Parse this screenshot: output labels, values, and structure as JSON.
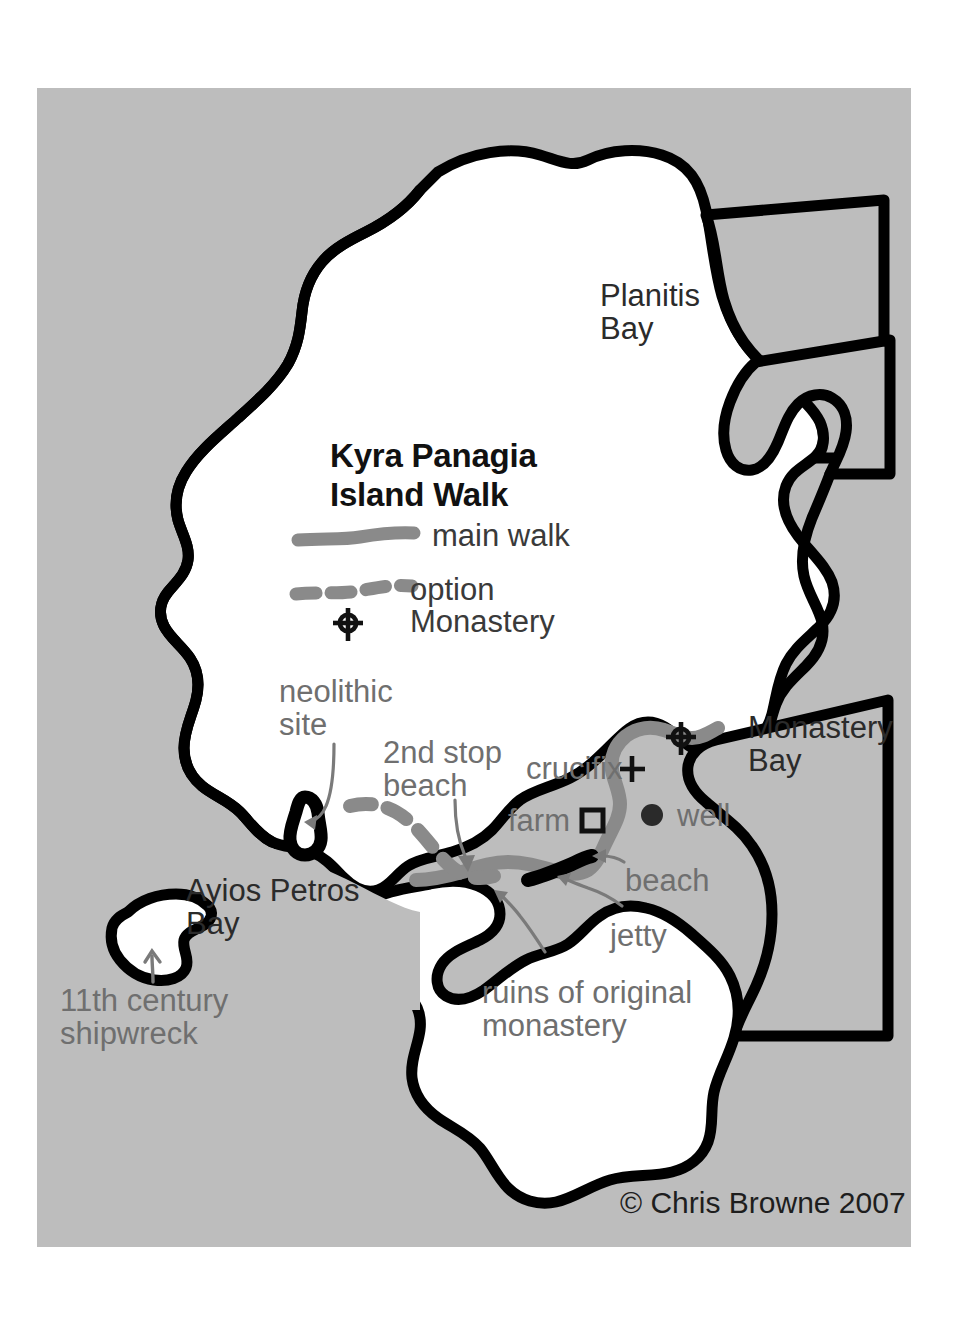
{
  "map": {
    "title_line1": "Kyra Panagia",
    "title_line2": "Island Walk",
    "copyright": "© Chris Browne 2007",
    "colors": {
      "sea": "#bdbdbd",
      "land": "#ffffff",
      "coastline": "#000000",
      "walk_route": "#8a8a8a",
      "annotation_text": "#6f6f6f",
      "place_text": "#2b2b2b",
      "page": "#ffffff"
    }
  },
  "legend": {
    "items": [
      {
        "key": "main-walk",
        "label": "main walk",
        "symbol": "solid-gray-line"
      },
      {
        "key": "option",
        "label": "option",
        "symbol": "dashed-gray-line"
      },
      {
        "key": "monastery",
        "label": "Monastery",
        "symbol": "cross-circle-icon"
      }
    ]
  },
  "places": [
    {
      "key": "planitis-bay",
      "label": "Planitis\nBay",
      "x": 600,
      "y": 280
    },
    {
      "key": "monastery-bay",
      "label": "Monastery\nBay",
      "x": 748,
      "y": 712
    },
    {
      "key": "ayios-petros-bay",
      "label": "Ayios Petros\nBay",
      "x": 186,
      "y": 875
    }
  ],
  "annotations": [
    {
      "key": "neolithic-site",
      "label": "neolithic\nsite",
      "x": 279,
      "y": 676,
      "style": "gray"
    },
    {
      "key": "second-stop-beach",
      "label": "2nd stop\nbeach",
      "x": 383,
      "y": 737,
      "style": "gray"
    },
    {
      "key": "crucifix",
      "label": "crucifix",
      "x": 526,
      "y": 753,
      "style": "gray"
    },
    {
      "key": "farm",
      "label": "farm",
      "x": 508,
      "y": 805,
      "style": "gray"
    },
    {
      "key": "well",
      "label": "well",
      "x": 677,
      "y": 800,
      "style": "gray"
    },
    {
      "key": "beach",
      "label": "beach",
      "x": 625,
      "y": 865,
      "style": "gray"
    },
    {
      "key": "jetty",
      "label": "jetty",
      "x": 610,
      "y": 920,
      "style": "gray"
    },
    {
      "key": "ruins",
      "label": "ruins of original\nmonastery",
      "x": 482,
      "y": 977,
      "style": "gray"
    },
    {
      "key": "shipwreck",
      "label": "11th century\nshipwreck",
      "x": 60,
      "y": 985,
      "style": "gray"
    }
  ],
  "symbols": [
    {
      "key": "crucifix-marker",
      "icon": "plus-icon",
      "x": 632,
      "y": 769
    },
    {
      "key": "farm-marker",
      "icon": "square-icon",
      "x": 592,
      "y": 820
    },
    {
      "key": "well-marker",
      "icon": "filled-dot-icon",
      "x": 652,
      "y": 815
    },
    {
      "key": "monastery-marker",
      "icon": "cross-circle-icon",
      "x": 681,
      "y": 737
    },
    {
      "key": "legend-monastery-marker",
      "icon": "cross-circle-icon",
      "x": 348,
      "y": 623
    }
  ]
}
